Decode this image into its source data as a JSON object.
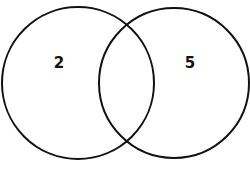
{
  "diagram": {
    "type": "venn",
    "sets": [
      {
        "name": "left-set",
        "only_count": "2"
      },
      {
        "name": "right-set",
        "only_count": "5"
      }
    ],
    "intersection_count": "",
    "colors": {
      "stroke": "#111111",
      "background": "#ffffff"
    }
  }
}
